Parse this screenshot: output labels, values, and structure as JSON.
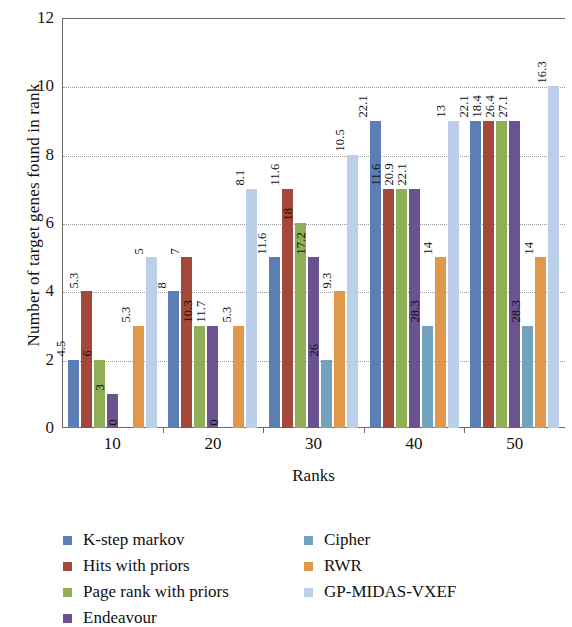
{
  "chart_data": {
    "type": "bar",
    "title": "",
    "xlabel": "Ranks",
    "ylabel": "Number of target genes found in rank",
    "categories": [
      "10",
      "20",
      "30",
      "40",
      "50"
    ],
    "ylim": [
      0,
      12
    ],
    "yticks": [
      0,
      2,
      4,
      6,
      8,
      10,
      12
    ],
    "grid": true,
    "legend_position": "bottom",
    "series": [
      {
        "name": "K-step markov",
        "color": "#5B7FB5",
        "values": [
          2,
          4,
          5,
          9,
          9
        ],
        "labels": [
          "4.5",
          "8",
          "11.6",
          "22.1",
          "22.1"
        ]
      },
      {
        "name": "Hits with priors",
        "color": "#A2493B",
        "values": [
          4,
          5,
          7,
          7,
          9
        ],
        "labels": [
          "5.3",
          "7",
          "11.6",
          "11.6",
          "18.4"
        ]
      },
      {
        "name": "Page rank with priors",
        "color": "#8FAE56",
        "values": [
          2,
          3,
          6,
          7,
          9
        ],
        "labels": [
          "6",
          "10.3",
          "18",
          "20.9",
          "26.4"
        ]
      },
      {
        "name": "Endeavour",
        "color": "#6B5291",
        "values": [
          1,
          3,
          5,
          7,
          9
        ],
        "labels": [
          "3",
          "11.7",
          "17.2",
          "22.1",
          "27.1"
        ]
      },
      {
        "name": "Cipher",
        "color": "#71A3BF",
        "values": [
          0,
          0,
          2,
          3,
          3
        ],
        "labels": [
          "0",
          "0",
          "26",
          "28.3",
          "28.3"
        ]
      },
      {
        "name": "RWR",
        "color": "#E0994A",
        "values": [
          3,
          3,
          4,
          5,
          5
        ],
        "labels": [
          "5.3",
          "5.3",
          "9.3",
          "14",
          "14"
        ]
      },
      {
        "name": "GP-MIDAS-VXEF",
        "color": "#BCCFE8",
        "values": [
          5,
          7,
          8,
          9,
          10
        ],
        "labels": [
          "5",
          "8.1",
          "10.5",
          "13",
          "16.3"
        ]
      }
    ],
    "legend_columns": [
      [
        "K-step markov",
        "Hits with priors",
        "Page rank with priors",
        "Endeavour"
      ],
      [
        "Cipher",
        "RWR",
        "GP-MIDAS-VXEF"
      ]
    ]
  }
}
